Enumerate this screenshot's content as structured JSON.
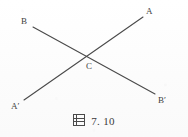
{
  "figure": {
    "caption_prefix": "图",
    "caption_number": "7. 10",
    "caption_full": "图 7.10",
    "stroke_color": "#4a4a4a",
    "background_color": "#fdfdfd",
    "label_color": "#3f3f3f",
    "width": 188,
    "height": 137
  },
  "labels": {
    "a": "A",
    "b": "B",
    "c": "C",
    "a_prime": "A′",
    "b_prime": "B′"
  },
  "geometry": {
    "type": "two-intersecting-line-segments",
    "intersection_point": {
      "label": "C",
      "x": 88,
      "y": 56
    },
    "segments": [
      {
        "name": "segment-A-Aprime",
        "from": {
          "label": "A′",
          "x": 24,
          "y": 100
        },
        "to": {
          "label": "A",
          "x": 143,
          "y": 17
        }
      },
      {
        "name": "segment-B-Bprime",
        "from": {
          "label": "B",
          "x": 33,
          "y": 27
        },
        "to": {
          "label": "B′",
          "x": 155,
          "y": 94
        }
      }
    ]
  }
}
